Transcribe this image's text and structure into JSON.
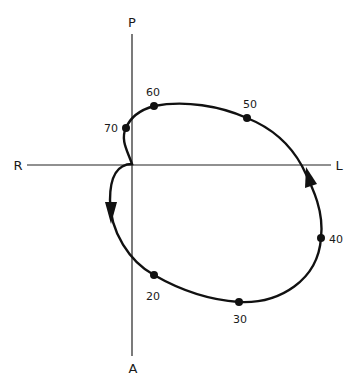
{
  "diagram": {
    "type": "vectorcardiogram-loop",
    "axes": {
      "top": "P",
      "bottom": "A",
      "left": "R",
      "right": "L"
    },
    "points": [
      {
        "label": "20",
        "x": 154,
        "y": 275
      },
      {
        "label": "30",
        "x": 239,
        "y": 302
      },
      {
        "label": "40",
        "x": 321,
        "y": 238
      },
      {
        "label": "50",
        "x": 247,
        "y": 118
      },
      {
        "label": "60",
        "x": 154,
        "y": 106
      },
      {
        "label": "70",
        "x": 126,
        "y": 128
      }
    ],
    "direction": "counterclockwise",
    "colors": {
      "line": "#111111",
      "background": "#ffffff"
    }
  }
}
